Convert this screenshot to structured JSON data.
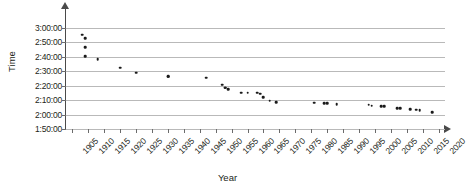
{
  "chart_data": {
    "type": "scatter",
    "title": "",
    "xlabel": "Year",
    "ylabel": "Time",
    "xlim": [
      1903,
      2022
    ],
    "ylim_seconds": [
      6600,
      10800
    ],
    "ylim_labels": [
      "1:50:00",
      "3:00:00"
    ],
    "grid": true,
    "legend": "none",
    "x_ticks": [
      1905,
      1910,
      1915,
      1920,
      1925,
      1930,
      1935,
      1940,
      1945,
      1950,
      1955,
      1960,
      1965,
      1970,
      1975,
      1980,
      1985,
      1990,
      1995,
      2000,
      2005,
      2010,
      2015,
      2020
    ],
    "y_ticks_seconds": [
      6600,
      7200,
      7800,
      8400,
      9000,
      9600,
      10200,
      10800
    ],
    "y_tick_labels": [
      "1:50:00",
      "2:00:00",
      "2:10:00",
      "2:20:00",
      "2:30:00",
      "2:40:00",
      "2:50:00",
      "3:00:00"
    ],
    "points": [
      {
        "x": 1908,
        "y": "2:55:18",
        "y_seconds": 10518
      },
      {
        "x": 1909,
        "y": "2:52:45",
        "y_seconds": 10365
      },
      {
        "x": 1909,
        "y": "2:46:52",
        "y_seconds": 10012
      },
      {
        "x": 1909,
        "y": "2:40:34",
        "y_seconds": 9634
      },
      {
        "x": 1913,
        "y": "2:38:16",
        "y_seconds": 9496
      },
      {
        "x": 1920,
        "y": "2:32:35",
        "y_seconds": 9155
      },
      {
        "x": 1925,
        "y": "2:29:01",
        "y_seconds": 8941
      },
      {
        "x": 1935,
        "y": "2:26:44",
        "y_seconds": 8804
      },
      {
        "x": 1935,
        "y": "2:26:20",
        "y_seconds": 8780
      },
      {
        "x": 1947,
        "y": "2:25:39",
        "y_seconds": 8739
      },
      {
        "x": 1952,
        "y": "2:20:42",
        "y_seconds": 8442
      },
      {
        "x": 1953,
        "y": "2:18:40",
        "y_seconds": 8320
      },
      {
        "x": 1953,
        "y": "2:18:34",
        "y_seconds": 8314
      },
      {
        "x": 1954,
        "y": "2:17:39",
        "y_seconds": 8259
      },
      {
        "x": 1958,
        "y": "2:15:17",
        "y_seconds": 8117
      },
      {
        "x": 1960,
        "y": "2:15:16",
        "y_seconds": 8116
      },
      {
        "x": 1963,
        "y": "2:15:15",
        "y_seconds": 8115
      },
      {
        "x": 1964,
        "y": "2:14:28",
        "y_seconds": 8068
      },
      {
        "x": 1965,
        "y": "2:12:11",
        "y_seconds": 7931
      },
      {
        "x": 1967,
        "y": "2:09:36",
        "y_seconds": 7776
      },
      {
        "x": 1969,
        "y": "2:08:33",
        "y_seconds": 7713
      },
      {
        "x": 1981,
        "y": "2:08:18",
        "y_seconds": 7698
      },
      {
        "x": 1984,
        "y": "2:08:05",
        "y_seconds": 7685
      },
      {
        "x": 1985,
        "y": "2:07:57",
        "y_seconds": 7677
      },
      {
        "x": 1988,
        "y": "2:07:11",
        "y_seconds": 7631
      },
      {
        "x": 1998,
        "y": "2:06:50",
        "y_seconds": 7610
      },
      {
        "x": 1999,
        "y": "2:06:05",
        "y_seconds": 7565
      },
      {
        "x": 2002,
        "y": "2:05:38",
        "y_seconds": 7538
      },
      {
        "x": 2003,
        "y": "2:05:42",
        "y_seconds": 7542
      },
      {
        "x": 2007,
        "y": "2:04:26",
        "y_seconds": 7466
      },
      {
        "x": 2008,
        "y": "2:04:26",
        "y_seconds": 7466
      },
      {
        "x": 2011,
        "y": "2:03:38",
        "y_seconds": 7418
      },
      {
        "x": 2013,
        "y": "2:03:23",
        "y_seconds": 7403
      },
      {
        "x": 2014,
        "y": "2:02:57",
        "y_seconds": 7377
      },
      {
        "x": 2018,
        "y": "2:01:39",
        "y_seconds": 7299
      }
    ]
  }
}
